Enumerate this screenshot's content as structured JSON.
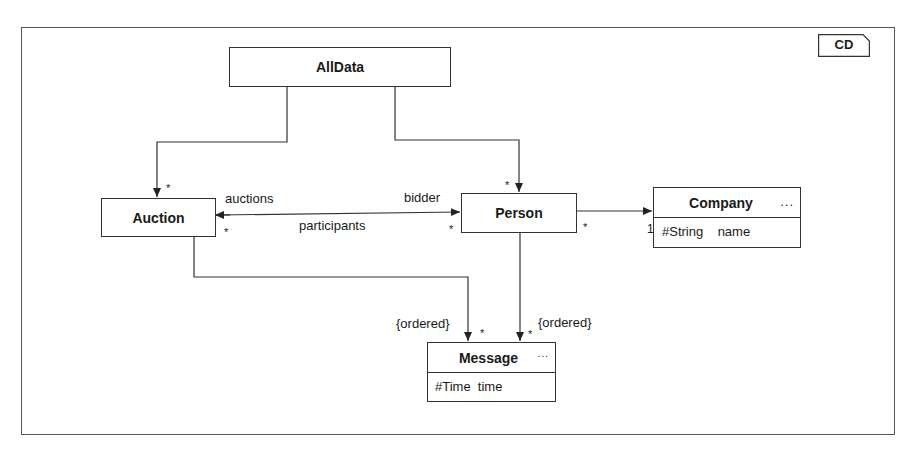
{
  "diagram": {
    "tag": "CD",
    "classes": {
      "alldata": {
        "name": "AllData"
      },
      "auction": {
        "name": "Auction"
      },
      "person": {
        "name": "Person"
      },
      "company": {
        "name": "Company",
        "more": "...",
        "attributes": [
          "#String    name"
        ]
      },
      "message": {
        "name": "Message",
        "more": "...",
        "attributes": [
          "#Time  time"
        ]
      }
    },
    "associations": [
      {
        "from": "AllData",
        "to": "Auction",
        "target_multiplicity": "*"
      },
      {
        "from": "AllData",
        "to": "Person",
        "target_multiplicity": "*"
      },
      {
        "from": "Person",
        "to": "Auction",
        "role_at_auction": "auctions",
        "role_at_person": "bidder",
        "label": "participants",
        "multiplicity_auction": "*",
        "multiplicity_person": "*"
      },
      {
        "from": "Person",
        "to": "Company",
        "source_multiplicity": "*",
        "target_multiplicity": "1"
      },
      {
        "from": "Auction",
        "to": "Message",
        "constraint": "{ordered}",
        "target_multiplicity": "*"
      },
      {
        "from": "Person",
        "to": "Message",
        "constraint": "{ordered}",
        "target_multiplicity": "*"
      }
    ],
    "labels": {
      "auctions": "auctions",
      "bidder": "bidder",
      "participants": "participants",
      "ordered_left": "{ordered}",
      "ordered_right": "{ordered}",
      "star": "*",
      "one": "1"
    }
  }
}
